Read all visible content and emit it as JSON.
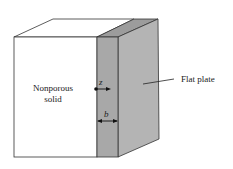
{
  "diagram": {
    "labels": {
      "solid_line1": "Nonporous",
      "solid_line2": "solid",
      "plate": "Flat plate",
      "z_axis": "z",
      "thickness": "b"
    },
    "colors": {
      "plate_front": "#a8a8a8",
      "plate_side": "#b4b4b4",
      "plate_top": "#9c9c9c",
      "solid_fill": "#ffffff",
      "line": "#333333"
    }
  }
}
